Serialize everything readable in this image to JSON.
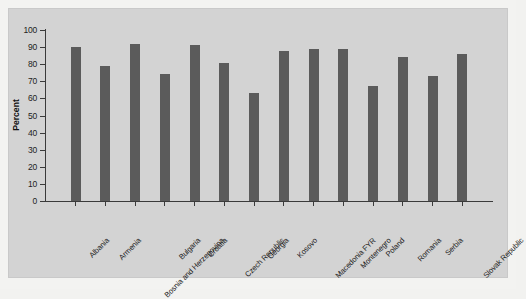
{
  "chart_data": {
    "type": "bar",
    "title": "",
    "xlabel": "",
    "ylabel": "Percent",
    "ylim": [
      0,
      100
    ],
    "yticks": [
      0,
      10,
      20,
      30,
      40,
      50,
      60,
      70,
      80,
      90,
      100
    ],
    "grid": false,
    "legend": null,
    "orientation": "vertical",
    "bar_color": "#5b5b5b",
    "panel_color": "#d3d3d3",
    "categories": [
      "Albania",
      "Armenia",
      "Bosnia and Herzegovina",
      "Bulgaria",
      "Croatia",
      "Czech Republic",
      "Georgia",
      "Kosovo",
      "Macedonia FYR",
      "Montenegro",
      "Poland",
      "Romania",
      "Serbia",
      "Slovak Republic"
    ],
    "values": [
      90,
      79,
      92,
      74,
      91,
      81,
      63,
      88,
      89,
      89,
      67,
      84,
      73,
      86
    ]
  }
}
